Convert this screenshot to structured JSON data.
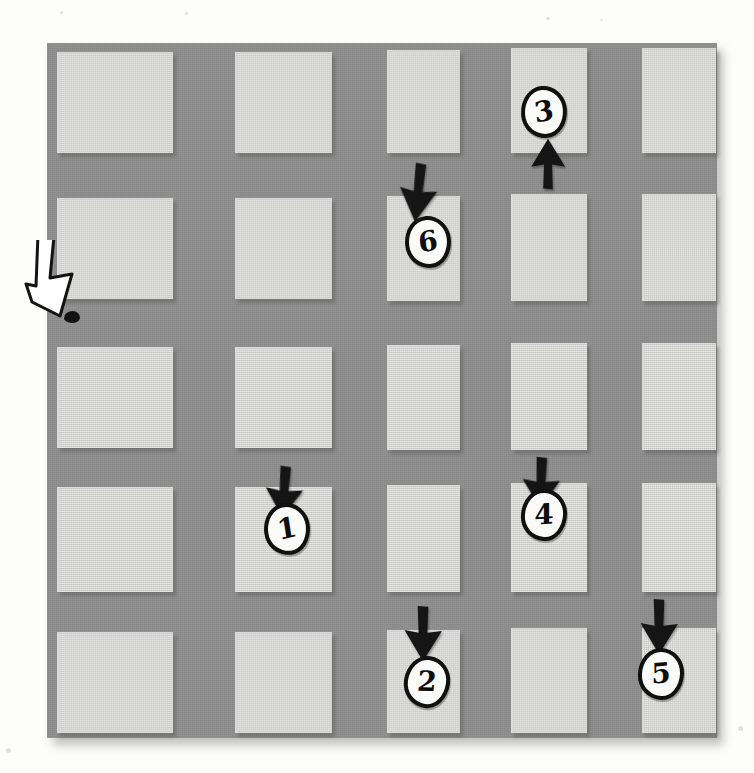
{
  "figure": {
    "kind": "annotated-photo-diagram",
    "page_background": "#fdfdfc",
    "panel_color": "#8e8e8e",
    "tile_color": "#d6d6d4",
    "ink_color": "#101010",
    "bubble_fill": "#fbfbfa"
  },
  "panel": {
    "left": 47,
    "top": 43,
    "width": 670,
    "height": 695,
    "rows": 5,
    "cols": 5
  },
  "tiles": [
    {
      "name": "tile-r1c1",
      "row": 1,
      "col": 1,
      "x": 10,
      "y": 9,
      "w": 115,
      "h": 100
    },
    {
      "name": "tile-r1c2",
      "row": 1,
      "col": 2,
      "x": 188,
      "y": 9,
      "w": 96,
      "h": 100
    },
    {
      "name": "tile-r1c3",
      "row": 1,
      "col": 3,
      "x": 340,
      "y": 7,
      "w": 72,
      "h": 102
    },
    {
      "name": "tile-r1c4",
      "row": 1,
      "col": 4,
      "x": 464,
      "y": 5,
      "w": 75,
      "h": 104
    },
    {
      "name": "tile-r1c5",
      "row": 1,
      "col": 5,
      "x": 595,
      "y": 5,
      "w": 73,
      "h": 104
    },
    {
      "name": "tile-r2c1",
      "row": 2,
      "col": 1,
      "x": 10,
      "y": 155,
      "w": 115,
      "h": 100
    },
    {
      "name": "tile-r2c2",
      "row": 2,
      "col": 2,
      "x": 188,
      "y": 155,
      "w": 96,
      "h": 100
    },
    {
      "name": "tile-r2c3",
      "row": 2,
      "col": 3,
      "x": 340,
      "y": 153,
      "w": 72,
      "h": 104
    },
    {
      "name": "tile-r2c4",
      "row": 2,
      "col": 4,
      "x": 464,
      "y": 151,
      "w": 75,
      "h": 106
    },
    {
      "name": "tile-r2c5",
      "row": 2,
      "col": 5,
      "x": 595,
      "y": 151,
      "w": 73,
      "h": 106
    },
    {
      "name": "tile-r3c1",
      "row": 3,
      "col": 1,
      "x": 10,
      "y": 304,
      "w": 115,
      "h": 100
    },
    {
      "name": "tile-r3c2",
      "row": 3,
      "col": 2,
      "x": 188,
      "y": 304,
      "w": 96,
      "h": 100
    },
    {
      "name": "tile-r3c3",
      "row": 3,
      "col": 3,
      "x": 340,
      "y": 302,
      "w": 72,
      "h": 104
    },
    {
      "name": "tile-r3c4",
      "row": 3,
      "col": 4,
      "x": 464,
      "y": 300,
      "w": 75,
      "h": 106
    },
    {
      "name": "tile-r3c5",
      "row": 3,
      "col": 5,
      "x": 595,
      "y": 300,
      "w": 73,
      "h": 106
    },
    {
      "name": "tile-r4c1",
      "row": 4,
      "col": 1,
      "x": 10,
      "y": 444,
      "w": 115,
      "h": 104
    },
    {
      "name": "tile-r4c2",
      "row": 4,
      "col": 2,
      "x": 188,
      "y": 444,
      "w": 96,
      "h": 104
    },
    {
      "name": "tile-r4c3",
      "row": 4,
      "col": 3,
      "x": 340,
      "y": 442,
      "w": 72,
      "h": 106
    },
    {
      "name": "tile-r4c4",
      "row": 4,
      "col": 4,
      "x": 464,
      "y": 440,
      "w": 75,
      "h": 108
    },
    {
      "name": "tile-r4c5",
      "row": 4,
      "col": 5,
      "x": 595,
      "y": 440,
      "w": 73,
      "h": 108
    },
    {
      "name": "tile-r5c1",
      "row": 5,
      "col": 1,
      "x": 10,
      "y": 589,
      "w": 115,
      "h": 100
    },
    {
      "name": "tile-r5c2",
      "row": 5,
      "col": 2,
      "x": 188,
      "y": 589,
      "w": 96,
      "h": 100
    },
    {
      "name": "tile-r5c3",
      "row": 5,
      "col": 3,
      "x": 340,
      "y": 587,
      "w": 72,
      "h": 102
    },
    {
      "name": "tile-r5c4",
      "row": 5,
      "col": 4,
      "x": 464,
      "y": 585,
      "w": 75,
      "h": 104
    },
    {
      "name": "tile-r5c5",
      "row": 5,
      "col": 5,
      "x": 595,
      "y": 585,
      "w": 73,
      "h": 104
    }
  ],
  "markers": [
    {
      "name": "marker-1",
      "label": "1",
      "x": 264,
      "y": 503,
      "rotate": -6,
      "on_tile": "tile-r4c2"
    },
    {
      "name": "marker-2",
      "label": "2",
      "x": 404,
      "y": 656,
      "rotate": 8,
      "on_tile": "tile-r5c3"
    },
    {
      "name": "marker-3",
      "label": "3",
      "x": 521,
      "y": 86,
      "rotate": -4,
      "on_tile": "tile-r1c4"
    },
    {
      "name": "marker-4",
      "label": "4",
      "x": 521,
      "y": 489,
      "rotate": 3,
      "on_tile": "tile-r4c4"
    },
    {
      "name": "marker-5",
      "label": "5",
      "x": 638,
      "y": 648,
      "rotate": 2,
      "on_tile": "tile-r5c5"
    },
    {
      "name": "marker-6",
      "label": "6",
      "x": 405,
      "y": 216,
      "rotate": -5,
      "on_tile": "tile-r2c3"
    }
  ],
  "arrows": [
    {
      "name": "arrow-to-marker-1",
      "direction": "down",
      "x": 262,
      "y": 466,
      "w": 44,
      "h": 52,
      "rotate": 4,
      "points_to": "marker-1"
    },
    {
      "name": "arrow-to-marker-2",
      "direction": "down",
      "x": 401,
      "y": 606,
      "w": 44,
      "h": 56,
      "rotate": 0,
      "points_to": "marker-2"
    },
    {
      "name": "arrow-to-marker-3",
      "direction": "up",
      "x": 528,
      "y": 138,
      "w": 40,
      "h": 52,
      "rotate": 0,
      "points_to": "marker-3"
    },
    {
      "name": "arrow-to-marker-4",
      "direction": "down",
      "x": 519,
      "y": 457,
      "w": 44,
      "h": 52,
      "rotate": 2,
      "points_to": "marker-4"
    },
    {
      "name": "arrow-to-marker-5",
      "direction": "down",
      "x": 637,
      "y": 599,
      "w": 44,
      "h": 56,
      "rotate": 0,
      "points_to": "marker-5"
    },
    {
      "name": "arrow-to-marker-6",
      "direction": "down",
      "x": 396,
      "y": 163,
      "w": 44,
      "h": 60,
      "rotate": 6,
      "points_to": "marker-6"
    }
  ],
  "pointer": {
    "name": "white-pointer-arrow",
    "x": 20,
    "y": 240,
    "w": 62,
    "h": 80,
    "fill": "#ffffff",
    "stroke": "#131313",
    "ink_dot": {
      "name": "ink-dot",
      "x": 64,
      "y": 311,
      "w": 16,
      "h": 12
    }
  },
  "specks": [
    {
      "x": 60,
      "y": 11,
      "w": 3,
      "h": 3
    },
    {
      "x": 185,
      "y": 12,
      "w": 3,
      "h": 3
    },
    {
      "x": 546,
      "y": 17,
      "w": 4,
      "h": 3
    },
    {
      "x": 600,
      "y": 19,
      "w": 3,
      "h": 2
    },
    {
      "x": 738,
      "y": 726,
      "w": 5,
      "h": 5
    },
    {
      "x": 6,
      "y": 748,
      "w": 5,
      "h": 5
    }
  ]
}
